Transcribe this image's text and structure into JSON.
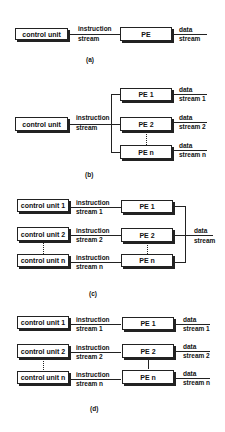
{
  "diagram_a": {
    "control_unit": "control unit",
    "instruction": "instruction",
    "stream": "stream",
    "pe": "PE",
    "data": "data",
    "data_stream": "stream",
    "caption": "(a)"
  },
  "diagram_b": {
    "control_unit": "control unit",
    "instruction": "instruction",
    "stream": "stream",
    "pes": [
      {
        "label": "PE 1",
        "data": "data",
        "stream": "stream 1"
      },
      {
        "label": "PE 2",
        "data": "data",
        "stream": "stream 2"
      },
      {
        "label": "PE n",
        "data": "data",
        "stream": "stream n"
      }
    ],
    "caption": "(b)"
  },
  "diagram_c": {
    "rows": [
      {
        "cu": "control unit 1",
        "instruction": "instruction",
        "stream": "stream 1",
        "pe": "PE 1"
      },
      {
        "cu": "control unit 2",
        "instruction": "instruction",
        "stream": "stream 2",
        "pe": "PE 2"
      },
      {
        "cu": "control unit n",
        "instruction": "instruction",
        "stream": "stream n",
        "pe": "PE n"
      }
    ],
    "data": "data",
    "data_stream": "stream",
    "caption": "(c)"
  },
  "diagram_d": {
    "rows": [
      {
        "cu": "control unit 1",
        "instruction": "instruction",
        "stream": "stream 1",
        "pe": "PE 1",
        "data": "data",
        "data_stream": "stream 1"
      },
      {
        "cu": "control unit 2",
        "instruction": "instruction",
        "stream": "stream 2",
        "pe": "PE 2",
        "data": "data",
        "data_stream": "stream 2"
      },
      {
        "cu": "control unit n",
        "instruction": "instruction",
        "stream": "stream n",
        "pe": "PE n",
        "data": "data",
        "data_stream": "stream n"
      }
    ],
    "caption": "(d)"
  }
}
